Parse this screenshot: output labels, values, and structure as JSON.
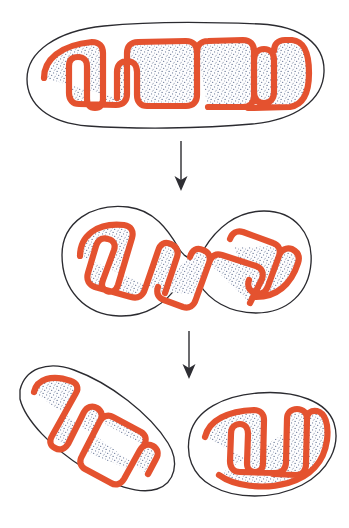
{
  "figure": {
    "background_color": "#ffffff",
    "width": 349,
    "height": 528,
    "style": "hand-drawn biological line illustration, stippled matrix"
  },
  "colors": {
    "outer_membrane_stroke": "#2b2b30",
    "inner_membrane_stroke": "#e4522f",
    "matrix_stipple": "#5a6b8c",
    "matrix_base": "#fdfdfe",
    "intermembrane_space": "#ffffff",
    "arrow": "#2e2e33",
    "background": "#ffffff"
  },
  "stages": [
    {
      "id": "stage-1",
      "order": 1,
      "label": "Single elongated mitochondrion",
      "description": "Intact rod-shaped mitochondrion with smooth outer membrane and deeply folded inner membrane forming cristae",
      "count": 1,
      "bodies": [
        {
          "name": "parent-mitochondrion",
          "outer_membrane": "M 27 79 C 27 52 56 31 104 26 C 152 21 214 22 260 24 C 302 26 325 45 324 72 C 323 100 296 120 252 124 C 200 129 132 129 88 126 C 48 123 27 104 27 79 Z",
          "inner_membrane": "M 44 78 C 44 60 60 45 92 42 L 92 42 C 99 42 103 46 103 53 L 103 99 C 103 105 100 108 95 108 C 90 108 87 105 87 99 L 87 66 C 87 60 83 57 78 57 C 72 57 69 60 69 66 L 69 93 C 69 100 73 104 79 104 L 116 105 C 123 105 127 101 127 94 L 127 53 C 127 46 131 42 138 42 L 186 41 C 193 41 197 45 197 52 L 197 95 C 197 102 193 106 186 106 L 147 106 C 141 106 137 102 137 95 L 137 72 C 137 65 133 61 127 61 C 121 61 117 65 117 72 L 117 98 M 197 52 C 197 45 201 41 208 41 L 243 40 C 250 40 254 44 254 51 L 254 96 C 254 103 250 107 243 107 L 208 107 M 254 60 C 254 53 258 49 264 49 C 270 49 274 53 274 60 L 274 92 C 274 99 270 103 264 103 C 258 103 254 99 254 92 M 274 51 C 274 44 278 40 285 40 L 292 40 C 303 41 309 50 309 73 C 309 95 302 105 290 107 L 248 108"
        }
      ]
    },
    {
      "id": "stage-2",
      "order": 2,
      "label": "Constricting mitochondrion",
      "description": "Mitochondrion begins to pinch in the middle forming a dumbbell or figure-eight shape as division proceeds",
      "count": 1,
      "bodies": [
        {
          "name": "constricting-mitochondrion",
          "outer_membrane": "M 62 255 C 62 222 92 203 128 207 C 154 210 168 230 178 247 C 186 261 196 262 204 249 C 216 229 236 211 264 211 C 295 211 313 234 311 263 C 309 292 288 313 256 313 C 228 313 209 299 200 285 C 193 274 184 274 177 286 C 167 302 147 317 119 316 C 85 315 62 290 62 255 Z",
          "inner_membrane": "M 80 256 C 80 236 97 222 124 225 C 131 226 134 231 132 238 L 118 285 C 116 291 112 293 107 291 C 102 289 101 285 103 280 L 114 250 C 116 244 113 240 108 239 C 102 237 98 240 96 246 L 88 273 C 86 280 89 285 95 287 L 131 297 C 138 299 143 296 145 289 L 158 251 C 160 244 165 241 171 244 C 177 247 179 251 177 257 L 165 293 M 190 257 C 192 250 197 247 203 250 C 209 252 211 257 209 263 L 196 299 C 194 306 189 309 183 307 L 164 300 C 158 298 156 293 158 287 M 209 263 C 211 257 215 253 222 255 L 256 266 C 262 268 264 273 262 279 L 250 303 M 230 239 C 232 233 237 230 243 232 L 273 243 C 279 245 281 250 279 256 L 268 286 C 266 292 261 295 255 293 C 249 291 247 286 249 280 M 279 256 C 281 250 286 247 292 249 C 298 252 300 257 298 263 C 291 285 276 297 256 297"
        }
      ]
    },
    {
      "id": "stage-3",
      "order": 3,
      "label": "Two separate daughter mitochondria",
      "description": "Division is complete; two independent daughter mitochondria each with their own outer membrane and cristae",
      "count": 2,
      "bodies": [
        {
          "name": "daughter-mitochondrion-left",
          "outer_membrane": "M 20 390 C 25 369 47 360 74 370 C 110 383 150 414 168 443 C 180 462 175 483 157 489 C 139 495 111 485 84 468 C 52 448 25 420 20 399 Z",
          "inner_membrane": "M 34 392 C 37 379 52 374 71 381 C 77 383 79 388 76 393 L 52 436 C 49 441 50 446 55 448 C 60 451 65 449 68 444 L 84 412 C 87 407 92 405 97 408 C 102 411 103 416 100 421 L 82 456 C 79 461 80 466 85 469 L 111 483 C 116 486 121 484 124 479 L 140 450 C 143 445 148 443 153 446 C 158 449 159 454 156 459 L 148 474 M 100 421 C 103 416 108 414 113 417 L 141 432 C 146 435 147 440 144 445 M 124 479 C 121 484 116 486 111 483"
        },
        {
          "name": "daughter-mitochondrion-right",
          "outer_membrane": "M 190 434 C 196 410 223 396 258 393 C 297 390 327 402 334 423 C 341 445 329 471 302 485 C 273 500 235 499 212 486 C 192 475 185 455 190 434 Z",
          "inner_membrane": "M 205 437 C 209 420 228 411 254 410 C 260 410 264 414 264 420 L 263 463 C 263 469 260 472 255 472 C 250 472 247 469 247 463 L 248 434 C 248 428 245 424 240 424 C 234 424 231 428 231 434 L 230 461 C 230 468 234 472 240 472 L 275 473 C 282 473 286 469 286 462 L 287 419 C 287 413 291 409 297 409 C 303 409 307 413 307 419 L 306 464 C 306 471 302 475 296 475 L 273 474 M 307 419 C 307 413 311 410 317 411 C 325 413 329 424 327 440 C 324 462 310 477 288 483 C 263 490 234 486 219 475"
        }
      ]
    }
  ],
  "arrows": [
    {
      "id": "arrow-1",
      "label": "progression arrow from stage 1 to stage 2",
      "direction": "down",
      "from_stage": "stage-1",
      "to_stage": "stage-2",
      "x": 181,
      "y_start": 141,
      "y_end": 190
    },
    {
      "id": "arrow-2",
      "label": "progression arrow from stage 2 to stage 3",
      "direction": "down",
      "from_stage": "stage-2",
      "to_stage": "stage-3",
      "x": 189,
      "y_start": 331,
      "y_end": 378
    }
  ]
}
